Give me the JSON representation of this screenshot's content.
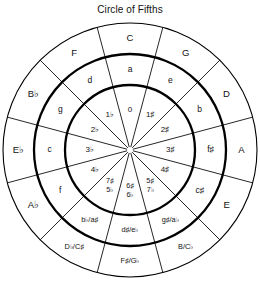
{
  "chart": {
    "title": "Circle of Fifths",
    "type": "radial-diagram",
    "geometry": {
      "center_x": 130,
      "center_y": 150,
      "radius_outer": 127,
      "radius_ring2": 96,
      "radius_ring3": 65,
      "radius_hub": 3,
      "segments": 12,
      "segment_degrees": 30,
      "rotation_offset_degrees": -15
    },
    "colors": {
      "background": "#ffffff",
      "stroke": "#000000",
      "text": "#111111"
    },
    "rings": [
      {
        "name": "major-keys",
        "label": "Outer ring: major keys"
      },
      {
        "name": "relative-minors",
        "label": "Middle ring: relative minor keys"
      },
      {
        "name": "key-signatures",
        "label": "Inner ring: key signature accidentals"
      }
    ],
    "positions": [
      {
        "index": 0,
        "clock": 12,
        "angle": 0,
        "major": "C",
        "minor": "a",
        "accidentals": "0",
        "major_dual": false,
        "minor_dual": false,
        "acc_dual": false
      },
      {
        "index": 1,
        "clock": 1,
        "angle": 30,
        "major": "G",
        "minor": "e",
        "accidentals": "1♯",
        "major_dual": false,
        "minor_dual": false,
        "acc_dual": false
      },
      {
        "index": 2,
        "clock": 2,
        "angle": 60,
        "major": "D",
        "minor": "b",
        "accidentals": "2♯",
        "major_dual": false,
        "minor_dual": false,
        "acc_dual": false
      },
      {
        "index": 3,
        "clock": 3,
        "angle": 90,
        "major": "A",
        "minor": "f♯",
        "accidentals": "3♯",
        "major_dual": false,
        "minor_dual": false,
        "acc_dual": false
      },
      {
        "index": 4,
        "clock": 4,
        "angle": 120,
        "major": "E",
        "minor": "c♯",
        "accidentals": "4♯",
        "major_dual": false,
        "minor_dual": false,
        "acc_dual": false
      },
      {
        "index": 5,
        "clock": 5,
        "angle": 150,
        "major": "B/C♭",
        "minor": "g♯/a♭",
        "accidentals": "5♯|7♭",
        "major_dual": true,
        "minor_dual": true,
        "acc_dual": true
      },
      {
        "index": 6,
        "clock": 6,
        "angle": 180,
        "major": "F♯/G♭",
        "minor": "d♯/e♭",
        "accidentals": "6♯|6♭",
        "major_dual": true,
        "minor_dual": true,
        "acc_dual": true
      },
      {
        "index": 7,
        "clock": 7,
        "angle": 210,
        "major": "D♭/C♯",
        "minor": "b♭/a♯",
        "accidentals": "7♯|5♭",
        "major_dual": true,
        "minor_dual": true,
        "acc_dual": true
      },
      {
        "index": 8,
        "clock": 8,
        "angle": 240,
        "major": "A♭",
        "minor": "f",
        "accidentals": "4♭",
        "major_dual": false,
        "minor_dual": false,
        "acc_dual": false
      },
      {
        "index": 9,
        "clock": 9,
        "angle": 270,
        "major": "E♭",
        "minor": "c",
        "accidentals": "3♭",
        "major_dual": false,
        "minor_dual": false,
        "acc_dual": false
      },
      {
        "index": 10,
        "clock": 10,
        "angle": 300,
        "major": "B♭",
        "minor": "g",
        "accidentals": "2♭",
        "major_dual": false,
        "minor_dual": false,
        "acc_dual": false
      },
      {
        "index": 11,
        "clock": 11,
        "angle": 330,
        "major": "F",
        "minor": "d",
        "accidentals": "1♭",
        "major_dual": false,
        "minor_dual": false,
        "acc_dual": false
      }
    ]
  }
}
